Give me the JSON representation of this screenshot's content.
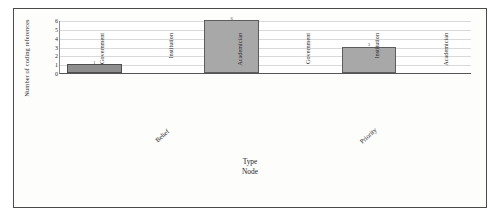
{
  "chart_data": {
    "type": "bar",
    "title": "",
    "subtitle": "",
    "xlabel_lines": [
      "Type",
      "Node"
    ],
    "ylabel": "Number of coding references",
    "ylim": [
      0,
      6
    ],
    "yticks": [
      0,
      1,
      2,
      3,
      4,
      5,
      6
    ],
    "grid": true,
    "legend": "none",
    "groups": [
      "Belief",
      "Priority"
    ],
    "categories": [
      "Government",
      "Institution",
      "Academician"
    ],
    "bars": [
      {
        "group": "Belief",
        "category": "Government",
        "value": 1,
        "label": "1"
      },
      {
        "group": "Belief",
        "category": "Institution",
        "value": 0,
        "label": ""
      },
      {
        "group": "Belief",
        "category": "Academician",
        "value": 6,
        "label": "6"
      },
      {
        "group": "Priority",
        "category": "Government",
        "value": 0,
        "label": ""
      },
      {
        "group": "Priority",
        "category": "Institution",
        "value": 3,
        "label": "3"
      },
      {
        "group": "Priority",
        "category": "Academician",
        "value": 0,
        "label": ""
      }
    ],
    "colors": {
      "bar_fill": "#a8a8a8",
      "bar_edge": "#5c5c5c",
      "gridline": "#d9d9d9",
      "axis": "#555555",
      "text": "#2a2a2a",
      "background": "#fdfdfc",
      "border": "#4a4a4a"
    }
  }
}
